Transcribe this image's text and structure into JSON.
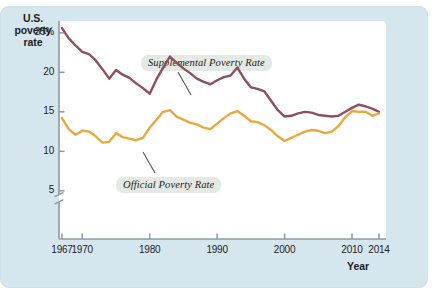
{
  "chart_data": {
    "type": "line",
    "title": "",
    "xlabel": "Year",
    "ylabel": "U.S. poverty rate",
    "ylabel_lines": [
      "U.S.",
      "poverty",
      "rate"
    ],
    "xlim": [
      1967,
      2014
    ],
    "ylim": [
      4,
      26.5
    ],
    "grid": false,
    "axis_break": true,
    "legend": "inline-annotations",
    "y_ticks": [
      "25%",
      "20",
      "15",
      "10",
      "5"
    ],
    "y_tick_values": [
      25,
      20,
      15,
      10,
      5
    ],
    "x_ticks": [
      "1967",
      "1970",
      "1980",
      "1990",
      "2000",
      "2010",
      "2014"
    ],
    "x_tick_values": [
      1967,
      1970,
      1980,
      1990,
      2000,
      2010,
      2014
    ],
    "colors": {
      "supplemental": "#8e4f60",
      "official": "#eaa93c",
      "panel": "#d6e6ef",
      "plot": "#ffffff",
      "axis": "#8d9aa3",
      "text": "#1c1c1c",
      "label_bg": "#e4e9e4"
    },
    "annotations": [
      {
        "text": "Supplemental Poverty Rate",
        "series": "supplemental"
      },
      {
        "text": "Official Poverty Rate",
        "series": "official"
      }
    ],
    "x": [
      1967,
      1968,
      1969,
      1970,
      1971,
      1972,
      1973,
      1974,
      1975,
      1976,
      1977,
      1978,
      1979,
      1980,
      1981,
      1982,
      1983,
      1984,
      1985,
      1986,
      1987,
      1988,
      1989,
      1990,
      1991,
      1992,
      1993,
      1994,
      1995,
      1996,
      1997,
      1998,
      1999,
      2000,
      2001,
      2002,
      2003,
      2004,
      2005,
      2006,
      2007,
      2008,
      2009,
      2010,
      2011,
      2012,
      2013,
      2014
    ],
    "series": [
      {
        "name": "Supplemental Poverty Rate",
        "color": "#8e4f60",
        "values": [
          25.6,
          24.3,
          23.4,
          22.6,
          22.3,
          21.5,
          20.4,
          19.2,
          20.3,
          19.7,
          19.3,
          18.6,
          18.0,
          17.3,
          19.1,
          20.6,
          22.0,
          21.2,
          20.5,
          19.9,
          19.2,
          18.8,
          18.5,
          19.0,
          19.4,
          19.6,
          20.6,
          19.2,
          18.1,
          17.9,
          17.6,
          16.4,
          15.2,
          14.4,
          14.5,
          14.8,
          15.0,
          14.9,
          14.6,
          14.5,
          14.4,
          14.5,
          15.0,
          15.5,
          15.9,
          15.7,
          15.4,
          15.0
        ]
      },
      {
        "name": "Official Poverty Rate",
        "color": "#eaa93c",
        "values": [
          14.2,
          12.8,
          12.1,
          12.6,
          12.5,
          11.9,
          11.1,
          11.2,
          12.3,
          11.8,
          11.6,
          11.4,
          11.7,
          13.0,
          14.0,
          15.0,
          15.2,
          14.4,
          14.0,
          13.6,
          13.4,
          13.0,
          12.8,
          13.5,
          14.2,
          14.8,
          15.1,
          14.5,
          13.8,
          13.7,
          13.3,
          12.7,
          11.9,
          11.3,
          11.7,
          12.1,
          12.5,
          12.7,
          12.6,
          12.3,
          12.5,
          13.2,
          14.3,
          15.1,
          15.0,
          15.0,
          14.5,
          14.8
        ]
      }
    ]
  }
}
